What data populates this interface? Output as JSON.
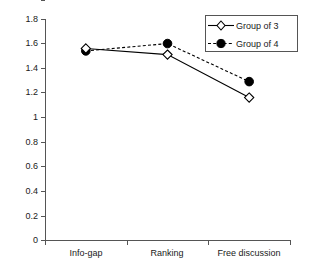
{
  "chart_data": {
    "type": "line",
    "title": "",
    "xlabel": "",
    "ylabel": "",
    "categories": [
      "Info-gap",
      "Ranking",
      "Free discussion"
    ],
    "ylim": [
      0,
      1.8
    ],
    "ytick_labels": [
      "1.8",
      "1.6",
      "1.4",
      "1.2",
      "1",
      "0.8",
      "0.6",
      "0.4",
      "0.2",
      "0"
    ],
    "ytick_values": [
      1.8,
      1.6,
      1.4,
      1.2,
      1.0,
      0.8,
      0.6,
      0.4,
      0.2,
      0.0
    ],
    "grid": false,
    "legend_position": "top-right",
    "series": [
      {
        "name": "Group of 3",
        "values": [
          1.56,
          1.51,
          1.16
        ],
        "marker": "open-diamond",
        "line_style": "solid",
        "color": "#000000"
      },
      {
        "name": "Group of 4",
        "values": [
          1.54,
          1.6,
          1.29
        ],
        "marker": "filled-circle",
        "line_style": "dashed",
        "color": "#000000"
      }
    ]
  },
  "legend": {
    "items": [
      {
        "label": "Group of 3",
        "marker": "open-diamond-icon"
      },
      {
        "label": "Group of 4",
        "marker": "filled-circle-icon"
      }
    ]
  },
  "colors": {
    "axis": "#555555",
    "series": "#000000",
    "background": "#ffffff",
    "text": "#1a1a1a"
  }
}
